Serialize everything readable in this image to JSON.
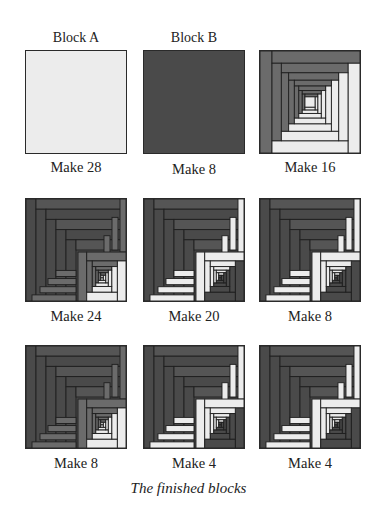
{
  "colors": {
    "light": "#ececec",
    "medium": "#6b6b6b",
    "dark": "#4a4a4a",
    "outline": "#1f1f1f"
  },
  "blocks": [
    {
      "title": "Block A",
      "label": "Make 28",
      "type": "solid",
      "fill": "light"
    },
    {
      "title": "Block B",
      "label": "Make 8",
      "type": "solid",
      "fill": "dark"
    },
    {
      "title": "",
      "label": "Make 16",
      "type": "logcabin",
      "variant": "c"
    },
    {
      "title": "",
      "label": "Make 24",
      "type": "logcabin",
      "variant": "d"
    },
    {
      "title": "",
      "label": "Make 20",
      "type": "logcabin",
      "variant": "e"
    },
    {
      "title": "",
      "label": "Make 8",
      "type": "logcabin",
      "variant": "f"
    },
    {
      "title": "",
      "label": "Make 8",
      "type": "logcabin",
      "variant": "d"
    },
    {
      "title": "",
      "label": "Make 4",
      "type": "logcabin",
      "variant": "e"
    },
    {
      "title": "",
      "label": "Make 4",
      "type": "logcabin",
      "variant": "f"
    }
  ],
  "caption": "The finished blocks"
}
